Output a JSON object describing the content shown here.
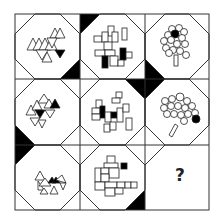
{
  "puzzle": {
    "type": "3x3 matrix reasoning puzzle",
    "rows": 3,
    "cols": 3,
    "grid": {
      "x": [
        15,
        80,
        145,
        209
      ],
      "y": [
        14,
        79,
        145,
        210
      ],
      "corner_cut": 20
    },
    "colors": {
      "line": "#333333",
      "fill": "#000000",
      "background": "#ffffff"
    },
    "cells": [
      {
        "row": 0,
        "col": 0,
        "figure": "triangle-cluster",
        "filled_element": "inverted triangle",
        "black_corners": [
          "bottom-right"
        ]
      },
      {
        "row": 0,
        "col": 1,
        "figure": "rectangle-cluster",
        "filled_element": "two rectangles",
        "black_corners": [
          "top-left"
        ]
      },
      {
        "row": 0,
        "col": 2,
        "figure": "circle-tree",
        "filled_element": "circle",
        "black_corners": [
          "bottom-left"
        ]
      },
      {
        "row": 1,
        "col": 0,
        "figure": "triangle-cluster",
        "filled_element": "triangles",
        "black_corners": [
          "bottom-left"
        ]
      },
      {
        "row": 1,
        "col": 1,
        "figure": "rectangle-cluster",
        "filled_element": "two rectangles",
        "black_corners": [
          "top-right"
        ]
      },
      {
        "row": 1,
        "col": 2,
        "figure": "circle-tree",
        "filled_element": "circle",
        "black_corners": [
          "top-left"
        ]
      },
      {
        "row": 2,
        "col": 0,
        "figure": "triangle-cluster",
        "filled_element": "triangle",
        "black_corners": [
          "top-left"
        ]
      },
      {
        "row": 2,
        "col": 1,
        "figure": "rectangle-cluster",
        "filled_element": "square",
        "black_corners": [
          "bottom-right"
        ]
      },
      {
        "row": 2,
        "col": 2,
        "figure": "unknown",
        "label": "?"
      }
    ],
    "missing_label": "?"
  }
}
